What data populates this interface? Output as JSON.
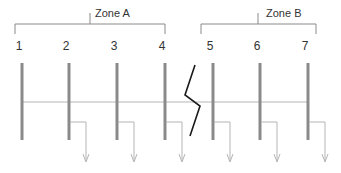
{
  "zones": [
    {
      "label": "Zone A",
      "x1": 15,
      "x2": 165,
      "tick_x": 90,
      "label_x": 95
    },
    {
      "label": "Zone B",
      "x1": 201,
      "x2": 316,
      "tick_x": 258,
      "label_x": 266
    }
  ],
  "columns": [
    {
      "label": "1",
      "x": 22,
      "tap": false
    },
    {
      "label": "2",
      "x": 69,
      "tap": true
    },
    {
      "label": "3",
      "x": 117,
      "tap": true
    },
    {
      "label": "4",
      "x": 165,
      "tap": true
    },
    {
      "label": "5",
      "x": 213,
      "tap": true
    },
    {
      "label": "6",
      "x": 260,
      "tap": true
    },
    {
      "label": "7",
      "x": 308,
      "tap": true
    }
  ],
  "colors": {
    "bar": "#8a8a8a",
    "line": "#b5b5b5",
    "bracket": "#8a8a8a",
    "break": "#1a1a1a",
    "text": "#333333"
  },
  "break_symbol": {
    "points": "195,65 185,95 200,106 190,136"
  }
}
